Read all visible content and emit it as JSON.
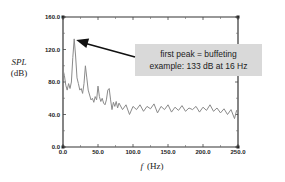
{
  "chart_data": {
    "type": "line",
    "title": "",
    "xlabel_var": "f",
    "xlabel_unit": "(Hz)",
    "ylabel_var": "SPL",
    "ylabel_unit": "(dB)",
    "xlim": [
      0,
      250
    ],
    "ylim": [
      0,
      160
    ],
    "grid": false,
    "x_ticks": [
      "0.0",
      "50.0",
      "100.0",
      "150.0",
      "200.0",
      "250.0"
    ],
    "y_ticks": [
      "0.0",
      "40.0",
      "80.0",
      "120.0",
      "160.0"
    ],
    "series": [
      {
        "name": "SPL spectrum",
        "color": "#8a8a8a",
        "x": [
          0,
          2,
          4,
          6,
          8,
          10,
          12,
          14,
          16,
          18,
          20,
          22,
          24,
          26,
          28,
          30,
          32,
          34,
          36,
          38,
          40,
          42,
          44,
          46,
          48,
          50,
          52,
          54,
          56,
          58,
          60,
          62,
          64,
          66,
          68,
          70,
          72,
          74,
          76,
          78,
          80,
          85,
          90,
          95,
          100,
          105,
          110,
          115,
          120,
          125,
          130,
          135,
          140,
          145,
          150,
          155,
          160,
          165,
          170,
          175,
          180,
          185,
          190,
          195,
          200,
          205,
          210,
          215,
          220,
          225,
          230,
          235,
          240,
          245,
          248,
          250
        ],
        "values": [
          95,
          88,
          76,
          70,
          78,
          72,
          80,
          110,
          133,
          112,
          85,
          78,
          70,
          72,
          66,
          78,
          100,
          85,
          70,
          64,
          58,
          60,
          55,
          62,
          58,
          75,
          62,
          56,
          60,
          54,
          52,
          58,
          70,
          72,
          58,
          46,
          55,
          50,
          56,
          48,
          54,
          46,
          52,
          40,
          50,
          46,
          52,
          44,
          50,
          47,
          53,
          42,
          50,
          46,
          52,
          43,
          49,
          45,
          51,
          44,
          48,
          46,
          50,
          43,
          49,
          45,
          52,
          44,
          48,
          42,
          47,
          40,
          46,
          35,
          45,
          42
        ]
      }
    ],
    "annotations": [
      {
        "text_line1": "first peak = buffeting",
        "text_line2": "example: 133 dB at 16 Hz",
        "arrow_to": {
          "x": 16,
          "y": 133
        },
        "box_color": "#d9d9d9"
      }
    ]
  }
}
